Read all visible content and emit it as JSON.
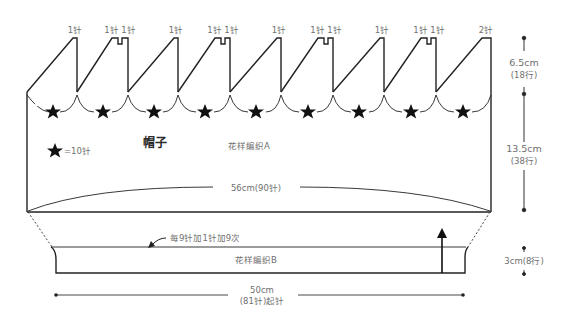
{
  "title": "帽子",
  "legend": {
    "symbol": "star",
    "text": "=10针"
  },
  "top_labels": [
    "1针",
    "1针 1针",
    "1针",
    "1针 1针",
    "1针",
    "1针 1针",
    "1针",
    "1针 1针",
    "2针"
  ],
  "main_body": {
    "pattern": "花样编织A",
    "width_label": "56cm(90针)"
  },
  "ribbing": {
    "pattern": "花样编织B",
    "increase_note": "每9针加1针加9次",
    "width_label_line1": "50cm",
    "width_label_line2": "(81针)起针"
  },
  "dimensions": {
    "crown_height_line1": "6.5cm",
    "crown_height_line2": "(18行)",
    "body_height_line1": "13.5cm",
    "body_height_line2": "(38行)",
    "ribbing_height": "3cm(8行)"
  },
  "stars_count": 9,
  "colors": {
    "line": "#222222",
    "text": "#6f6f6f",
    "title": "#2a2a2a"
  }
}
